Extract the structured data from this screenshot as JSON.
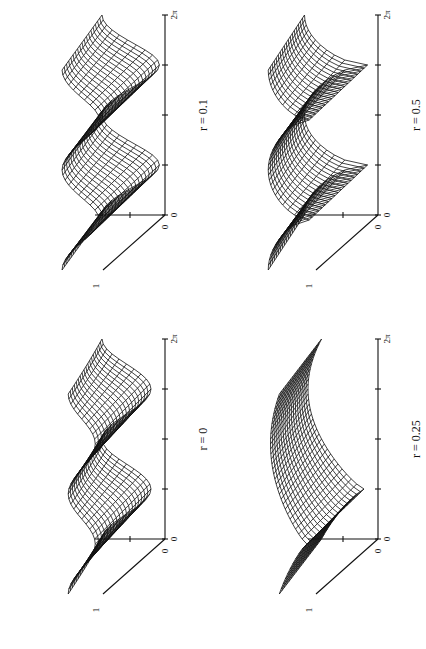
{
  "figure": {
    "orientation": "rotated-90-ccw",
    "colors": {
      "line": "#111111",
      "background": "#ffffff"
    }
  },
  "chart_data": [
    {
      "type": "surface-wireframe",
      "label": "r = 0",
      "panel_position": "bottom-left",
      "x_axis": {
        "ticks": [
          "0",
          "",
          "",
          "",
          "2π"
        ],
        "range": [
          "0",
          "2π"
        ]
      },
      "z_axis": {
        "ticks": [
          "1"
        ]
      },
      "depth_axis": {
        "ticks": [
          "0",
          "1"
        ]
      },
      "shape": "two rounded ridges along θ, decaying with depth"
    },
    {
      "type": "surface-wireframe",
      "label": "r = 0.1",
      "panel_position": "top-left",
      "x_axis": {
        "ticks": [
          "0",
          "",
          "",
          "",
          "2π"
        ],
        "range": [
          "0",
          "2π"
        ]
      },
      "z_axis": {
        "ticks": [
          "1"
        ]
      },
      "depth_axis": {
        "ticks": [
          "0",
          "1"
        ]
      },
      "shape": "two ridges with a sharper dip between them"
    },
    {
      "type": "surface-wireframe",
      "label": "r = 0.25",
      "panel_position": "bottom-right",
      "x_axis": {
        "ticks": [
          "0",
          "",
          "",
          "",
          "2π"
        ],
        "range": [
          "0",
          "2π"
        ]
      },
      "z_axis": {
        "ticks": [
          "1"
        ]
      },
      "depth_axis": {
        "ticks": [
          "0",
          "1"
        ]
      },
      "shape": "single broad ridge with a cusp valley near θ≈π/2"
    },
    {
      "type": "surface-wireframe",
      "label": "r = 0.5",
      "panel_position": "top-right",
      "x_axis": {
        "ticks": [
          "0",
          "",
          "",
          "",
          "2π"
        ],
        "range": [
          "0",
          "2π"
        ]
      },
      "z_axis": {
        "ticks": [
          "1",
          "2"
        ]
      },
      "depth_axis": {
        "ticks": [
          "0",
          "1"
        ]
      },
      "shape": "two sharp V-shaped cusps at θ≈π/2 and 3π/2"
    }
  ]
}
